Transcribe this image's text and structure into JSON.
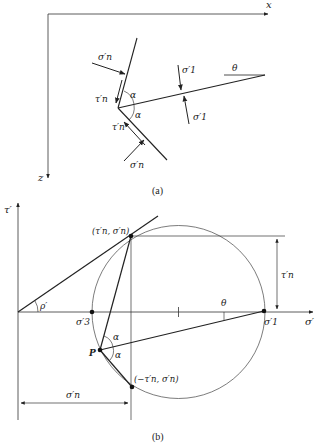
{
  "figure_a": {
    "caption": "(a)",
    "axis_x_label": "x",
    "axis_z_label": "z",
    "sigma_n_top": "σ′n",
    "sigma_n_bottom": "σ′n",
    "tau_n_top": "τ′n",
    "tau_n_bottom": "τ′n",
    "sigma_1_top": "σ′1",
    "sigma_1_bottom": "σ′1",
    "alpha_top": "α",
    "alpha_bottom": "α",
    "theta": "θ"
  },
  "figure_b": {
    "caption": "(b)",
    "axis_tau_label": "τ′",
    "axis_sigma_label": "σ′",
    "phi": "ρ′",
    "sigma_3": "σ′3",
    "sigma_1": "σ′1",
    "theta": "θ",
    "point_upper": "(τ′n, σ′n)",
    "point_lower": "(−τ′n, σ′n)",
    "pole": "P",
    "alpha_top": "α",
    "alpha_bottom": "α",
    "dim_tau_n": "τ′n",
    "dim_sigma_n": "σ′n"
  }
}
